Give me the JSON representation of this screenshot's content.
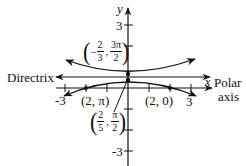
{
  "axes": {
    "x_label": "x",
    "y_label": "y",
    "x_ticks": [
      "-3",
      "3"
    ],
    "y_ticks": [
      "3",
      "-3"
    ]
  },
  "labels": {
    "directrix": "Directrix",
    "polar": "Polar",
    "axis": "axis",
    "point_2_pi": "(2, π)",
    "point_2_0": "(2, 0)",
    "vertex_top": {
      "num1": "2",
      "den1": "3",
      "num2": "3π",
      "den2": "2",
      "sign": "−"
    },
    "vertex_bottom": {
      "num1": "2",
      "den1": "5",
      "num2": "π",
      "den2": "2"
    }
  },
  "colors": {
    "ink": "#111111",
    "background": "#ffffff"
  }
}
